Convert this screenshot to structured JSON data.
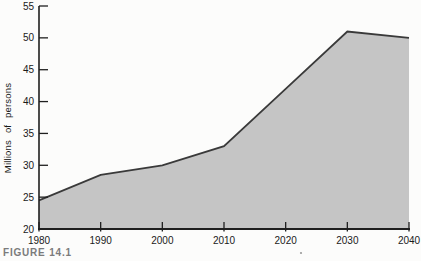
{
  "figure": {
    "caption": "FIGURE 14.1"
  },
  "colors": {
    "background": "#fcfcfb",
    "area_fill": "#c5c5c5",
    "line": "#3a3a3a",
    "axis": "#1f1f1f",
    "tick_text": "#1a1a1a",
    "caption_text": "#7b7b7b",
    "speck": "#9a9a9a"
  },
  "chart_data": {
    "type": "area",
    "x": [
      1980,
      1990,
      2000,
      2010,
      2020,
      2030,
      2040
    ],
    "values": [
      24.5,
      28.5,
      30,
      33,
      42,
      51,
      50
    ],
    "title": "",
    "xlabel": "",
    "ylabel": "Millions of persons",
    "xlim": [
      1980,
      2040
    ],
    "ylim": [
      20,
      55
    ],
    "xticks": [
      1980,
      1990,
      2000,
      2010,
      2020,
      2030,
      2040
    ],
    "yticks": [
      20,
      25,
      30,
      35,
      40,
      45,
      50,
      55
    ],
    "grid": false,
    "legend": "none",
    "area_closed_to_baseline": true
  }
}
